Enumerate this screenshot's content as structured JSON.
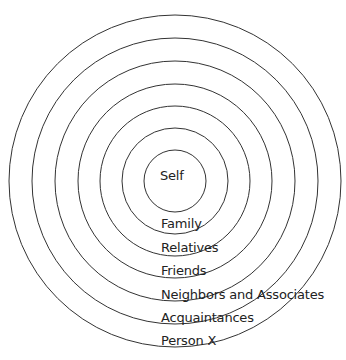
{
  "diagram": {
    "type": "concentric-circles",
    "center": {
      "x": 175,
      "y": 181
    },
    "stroke_color": "#333333",
    "rings": [
      {
        "name": "self",
        "label": "Self",
        "radius": 31
      },
      {
        "name": "family",
        "label": "Family",
        "radius": 53
      },
      {
        "name": "relatives",
        "label": "Relatives",
        "radius": 75
      },
      {
        "name": "friends",
        "label": "Friends",
        "radius": 97
      },
      {
        "name": "neighbors-and-associates",
        "label": "Neighbors and Associates",
        "radius": 120
      },
      {
        "name": "acquaintances",
        "label": "Acquaintances",
        "radius": 143
      },
      {
        "name": "person-x",
        "label": "Person X",
        "radius": 166
      }
    ]
  }
}
